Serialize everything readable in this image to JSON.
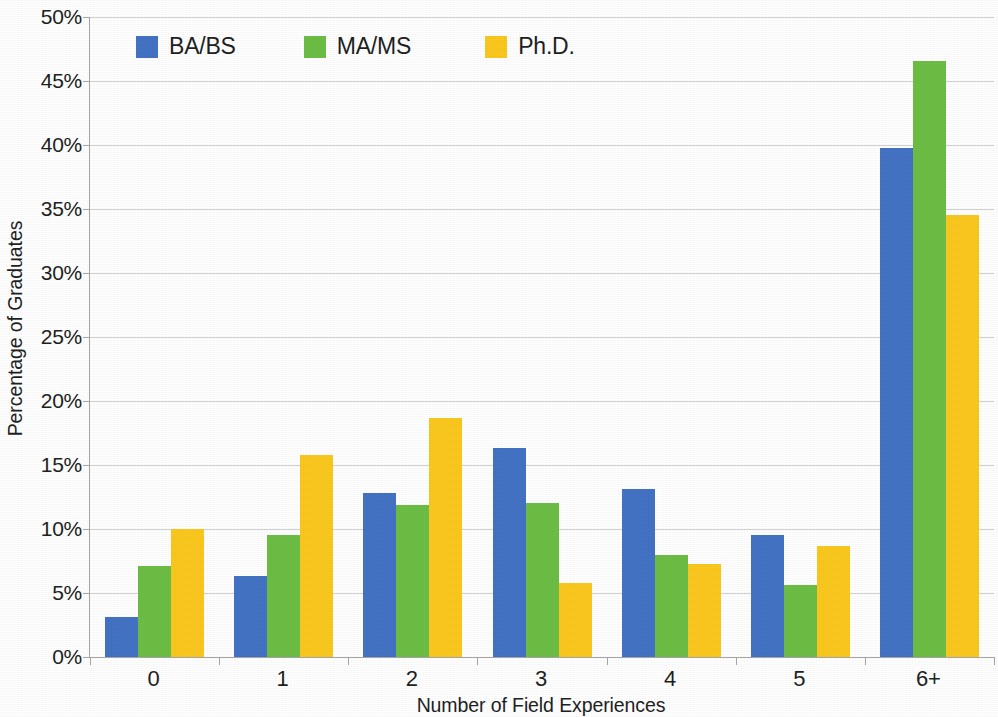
{
  "chart_data": {
    "type": "bar",
    "title": "",
    "subtitle": "",
    "xlabel": "Number of Field Experiences",
    "ylabel": "Percentage of Graduates",
    "categories": [
      "0",
      "1",
      "2",
      "3",
      "4",
      "5",
      "6+"
    ],
    "series": [
      {
        "name": "BA/BS",
        "color": "#4472C4",
        "values": [
          3.1,
          6.3,
          12.8,
          16.3,
          13.1,
          9.5,
          39.8
        ]
      },
      {
        "name": "MA/MS",
        "color": "#6CBE45",
        "values": [
          7.1,
          9.5,
          11.9,
          12.0,
          8.0,
          5.6,
          46.6
        ]
      },
      {
        "name": "Ph.D.",
        "color": "#FBC81E",
        "values": [
          10.0,
          15.8,
          18.7,
          5.8,
          7.3,
          8.7,
          34.5
        ]
      }
    ],
    "ylim": [
      0,
      50
    ],
    "ytick_step": 5,
    "ytick_labels": [
      "0%",
      "5%",
      "10%",
      "15%",
      "20%",
      "25%",
      "30%",
      "35%",
      "40%",
      "45%",
      "50%"
    ],
    "ytick_values": [
      0,
      5,
      10,
      15,
      20,
      25,
      30,
      35,
      40,
      45,
      50
    ],
    "grid": {
      "horizontal": true,
      "vertical": false,
      "color": "#D2D2D2"
    },
    "legend": {
      "position": "top-left",
      "entries": [
        "BA/BS",
        "MA/MS",
        "Ph.D."
      ]
    },
    "axis_color": "#A6A6A6",
    "background": "#FFFFFF"
  }
}
